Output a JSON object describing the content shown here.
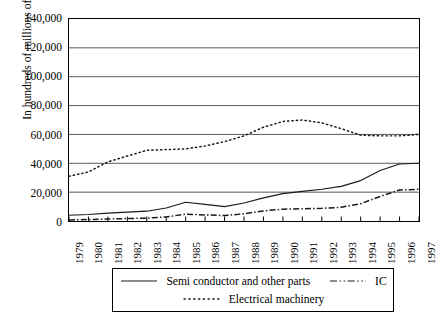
{
  "chart_data": {
    "type": "line",
    "title": "",
    "xlabel": "",
    "ylabel": "In hundreds of millions of yen",
    "x": [
      "1979",
      "1980",
      "1981",
      "1982",
      "1983",
      "1984",
      "1985",
      "1986",
      "1987",
      "1988",
      "1989",
      "1990",
      "1991",
      "1992",
      "1993",
      "1994",
      "1995",
      "1996",
      "1997"
    ],
    "ylim": [
      0,
      140000
    ],
    "yticks": [
      "0",
      "20,000",
      "40,000",
      "60,000",
      "80,000",
      "100,000",
      "120,000",
      "140,000"
    ],
    "ytick_values": [
      0,
      20000,
      40000,
      60000,
      80000,
      100000,
      120000,
      140000
    ],
    "grid": "horizontal",
    "legend_position": "bottom",
    "series": [
      {
        "name": "Semi conductor and other parts",
        "style": "solid",
        "values": [
          4000,
          4500,
          5500,
          6200,
          6800,
          9000,
          13000,
          11500,
          10000,
          12500,
          16000,
          19000,
          20500,
          22000,
          24000,
          28000,
          35000,
          39500,
          40000
        ]
      },
      {
        "name": "IC",
        "style": "dash-dot",
        "values": [
          700,
          1000,
          1400,
          1700,
          2000,
          2800,
          4800,
          4200,
          3800,
          5000,
          7000,
          8200,
          8500,
          8800,
          9500,
          12000,
          17000,
          21500,
          22000
        ]
      },
      {
        "name": "Electrical machinery",
        "style": "dotted",
        "values": [
          31000,
          34000,
          41000,
          45000,
          49000,
          49500,
          50000,
          52000,
          55000,
          59000,
          65000,
          69000,
          70000,
          68000,
          64000,
          59500,
          59000,
          59000,
          60000
        ]
      }
    ]
  },
  "legend": {
    "items": [
      {
        "label": "Semi conductor and other parts",
        "key": "solid-line-key"
      },
      {
        "label": "IC",
        "key": "dash-dot-line-key"
      },
      {
        "label": "Electrical machinery",
        "key": "dotted-line-key"
      }
    ]
  },
  "colors": {
    "axis": "#000000",
    "grid": "#595959",
    "series": "#1a1a1a",
    "background": "#ffffff"
  }
}
